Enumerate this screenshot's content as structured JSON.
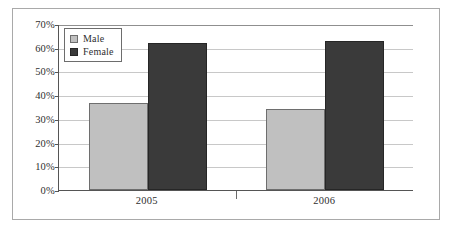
{
  "chart_data": {
    "type": "bar",
    "title": "",
    "subtitle": "",
    "xlabel": "",
    "ylabel": "",
    "categories": [
      "2005",
      "2006"
    ],
    "series": [
      {
        "name": "Male",
        "color": "#c0c0c0",
        "values": [
          36.5,
          34.0
        ]
      },
      {
        "name": "Female",
        "color": "#3a3a3a",
        "values": [
          62.0,
          63.0
        ]
      }
    ],
    "ylim": [
      0,
      70
    ],
    "ytick_values": [
      0,
      10,
      20,
      30,
      40,
      50,
      60,
      70
    ],
    "ytick_labels": [
      "0%",
      "10%",
      "20%",
      "30%",
      "40%",
      "50%",
      "60%",
      "70%"
    ],
    "grid": true,
    "grid_axis": "y",
    "legend_position": "top-left",
    "legend_entries": [
      "Male",
      "Female"
    ],
    "frame": true,
    "value_suffix": "%"
  },
  "legend": {
    "items": [
      {
        "label": "Male",
        "swatch": "male-swatch"
      },
      {
        "label": "Female",
        "swatch": "female-swatch"
      }
    ]
  },
  "axes": {
    "y_labels": [
      "70%",
      "60%",
      "50%",
      "40%",
      "30%",
      "20%",
      "10%",
      "0%"
    ],
    "x_labels": [
      "2005",
      "2006"
    ]
  }
}
